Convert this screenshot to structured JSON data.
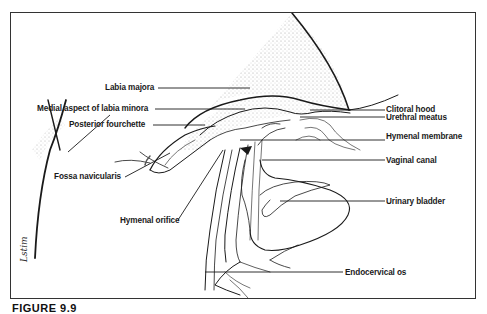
{
  "figure": {
    "caption": "FIGURE 9.9",
    "signature": "Lstim",
    "colors": {
      "line": "#1a1a1a",
      "frame": "#333333",
      "stipple": "#9a9a9a",
      "background": "#ffffff"
    }
  },
  "labels": {
    "left": [
      {
        "id": "labia-majora",
        "text": "Labia majora"
      },
      {
        "id": "medial-aspect-labia-minora",
        "text": "Medial aspect of labia minora"
      },
      {
        "id": "posterior-fourchette",
        "text": "Posterior fourchette"
      },
      {
        "id": "fossa-navicularis",
        "text": "Fossa navicularis"
      },
      {
        "id": "hymenal-orifice",
        "text": "Hymenal orifice"
      }
    ],
    "right": [
      {
        "id": "clitoral-hood",
        "text": "Clitoral hood"
      },
      {
        "id": "urethral-meatus",
        "text": "Urethral meatus"
      },
      {
        "id": "hymenal-membrane",
        "text": "Hymenal membrane"
      },
      {
        "id": "vaginal-canal",
        "text": "Vaginal canal"
      },
      {
        "id": "urinary-bladder",
        "text": "Urinary bladder"
      },
      {
        "id": "endocervical-os",
        "text": "Endocervical os"
      }
    ]
  }
}
